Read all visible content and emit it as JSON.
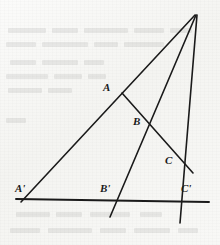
{
  "figure": {
    "background_color": "#f7f7f5",
    "stroke_color": "#1a1a1a",
    "canvas": {
      "width": 220,
      "height": 245
    },
    "points": [
      {
        "id": "apex",
        "label": "",
        "x": 195,
        "y": 15
      },
      {
        "id": "A",
        "label": "A",
        "x": 125,
        "y": 95,
        "label_x": 103,
        "label_y": 82
      },
      {
        "id": "B",
        "label": "B",
        "x": 147,
        "y": 122,
        "label_x": 133,
        "label_y": 116
      },
      {
        "id": "C",
        "label": "C",
        "x": 180,
        "y": 160,
        "label_x": 165,
        "label_y": 155
      },
      {
        "id": "Ap",
        "label": "A'",
        "x": 23,
        "y": 200,
        "label_x": 15,
        "label_y": 183
      },
      {
        "id": "Bp",
        "label": "B'",
        "x": 114,
        "y": 199,
        "label_x": 100,
        "label_y": 183
      },
      {
        "id": "Cp",
        "label": "C'",
        "x": 180,
        "y": 201,
        "label_x": 181,
        "label_y": 183
      }
    ],
    "lines": [
      {
        "id": "ray-apex-to-Aprime",
        "name": "left-ray",
        "x1": 195,
        "y1": 15,
        "x2": 21,
        "y2": 202,
        "width": 1.6
      },
      {
        "id": "ray-apex-to-Bprime",
        "name": "middle-ray",
        "x1": 196,
        "y1": 15,
        "x2": 110,
        "y2": 217,
        "width": 1.6
      },
      {
        "id": "ray-apex-to-Cprime",
        "name": "right-ray",
        "x1": 197,
        "y1": 15,
        "x2": 180,
        "y2": 223,
        "width": 1.6
      },
      {
        "id": "transversal-A-B-C",
        "name": "transversal-upper",
        "x1": 122,
        "y1": 93,
        "x2": 193,
        "y2": 173,
        "width": 1.6
      },
      {
        "id": "baseline-Aprime-Bprime-Cprime",
        "name": "baseline",
        "x1": 16,
        "y1": 199,
        "x2": 209,
        "y2": 202,
        "width": 1.9
      }
    ],
    "labels": {
      "A": "A",
      "B": "B",
      "C": "C",
      "A_prime": "A'",
      "B_prime": "B'",
      "C_prime": "C'"
    }
  },
  "bleed_through": {
    "description": "faint reversed text showing through from the other side of the page",
    "rows": [
      {
        "x": 8,
        "y": 28,
        "w": 38
      },
      {
        "x": 52,
        "y": 28,
        "w": 26
      },
      {
        "x": 84,
        "y": 28,
        "w": 44
      },
      {
        "x": 134,
        "y": 28,
        "w": 30
      },
      {
        "x": 170,
        "y": 28,
        "w": 22
      },
      {
        "x": 6,
        "y": 42,
        "w": 30
      },
      {
        "x": 42,
        "y": 42,
        "w": 46
      },
      {
        "x": 94,
        "y": 42,
        "w": 24
      },
      {
        "x": 124,
        "y": 42,
        "w": 40
      },
      {
        "x": 10,
        "y": 60,
        "w": 26
      },
      {
        "x": 42,
        "y": 60,
        "w": 36
      },
      {
        "x": 84,
        "y": 60,
        "w": 20
      },
      {
        "x": 6,
        "y": 74,
        "w": 42
      },
      {
        "x": 54,
        "y": 74,
        "w": 28
      },
      {
        "x": 88,
        "y": 74,
        "w": 18
      },
      {
        "x": 8,
        "y": 88,
        "w": 34
      },
      {
        "x": 48,
        "y": 88,
        "w": 24
      },
      {
        "x": 6,
        "y": 118,
        "w": 20
      },
      {
        "x": 16,
        "y": 212,
        "w": 34
      },
      {
        "x": 56,
        "y": 212,
        "w": 26
      },
      {
        "x": 90,
        "y": 212,
        "w": 40
      },
      {
        "x": 140,
        "y": 212,
        "w": 22
      },
      {
        "x": 10,
        "y": 228,
        "w": 30
      },
      {
        "x": 48,
        "y": 228,
        "w": 44
      },
      {
        "x": 100,
        "y": 228,
        "w": 26
      },
      {
        "x": 134,
        "y": 228,
        "w": 36
      },
      {
        "x": 178,
        "y": 228,
        "w": 20
      }
    ]
  }
}
